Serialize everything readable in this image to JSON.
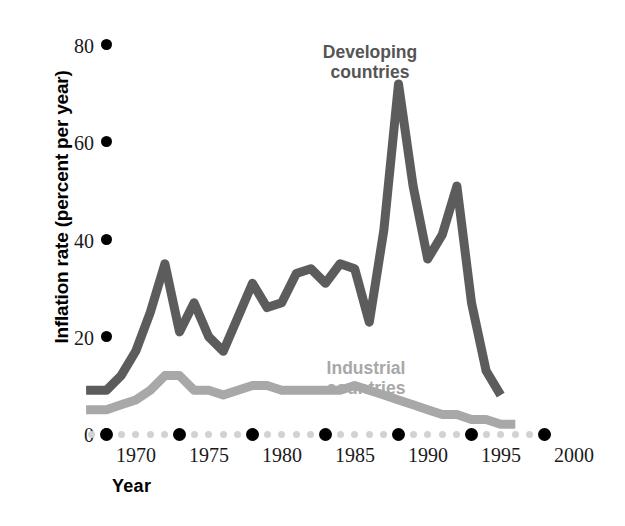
{
  "chart_data": {
    "type": "line",
    "title": "",
    "xlabel": "Year",
    "ylabel": "Inflation rate (percent per year)",
    "xlim": [
      1968,
      2001
    ],
    "ylim": [
      0,
      84
    ],
    "grid": false,
    "legend_position": "inline-annotation",
    "xticks": [
      "1970",
      "1975",
      "1980",
      "1985",
      "1990",
      "1995",
      "2000"
    ],
    "xtick_values": [
      1970,
      1975,
      1980,
      1985,
      1990,
      1995,
      2000
    ],
    "yticks": [
      "0",
      "20",
      "40",
      "60",
      "80"
    ],
    "ytick_values": [
      0,
      20,
      40,
      60,
      80
    ],
    "colors": {
      "developing": "#5c5c5c",
      "industrial": "#a8a8a8",
      "axis_dot_major": "#000000",
      "axis_dot_minor": "#d2d2d2",
      "text": "#1a1a1a"
    },
    "series": [
      {
        "name": "Developing countries",
        "color": "#5c5c5c",
        "x": [
          1968.6,
          1970,
          1971,
          1972,
          1973,
          1974,
          1975,
          1976,
          1977,
          1978,
          1979,
          1980,
          1981,
          1982,
          1983,
          1984,
          1985,
          1986,
          1987,
          1988,
          1989,
          1990,
          1991,
          1992,
          1993,
          1994,
          1995,
          1996,
          1997
        ],
        "values": [
          9,
          9,
          12,
          17,
          25,
          35,
          21,
          27,
          20,
          17,
          24,
          31,
          26,
          27,
          33,
          34,
          31,
          35,
          34,
          23,
          42,
          72,
          51,
          36,
          41,
          51,
          27,
          13,
          8
        ]
      },
      {
        "name": "Industrial countries",
        "color": "#a8a8a8",
        "x": [
          1968.6,
          1970,
          1971,
          1972,
          1973,
          1974,
          1975,
          1976,
          1977,
          1978,
          1979,
          1980,
          1981,
          1982,
          1983,
          1984,
          1985,
          1986,
          1987,
          1988,
          1989,
          1990,
          1991,
          1992,
          1993,
          1994,
          1995,
          1996,
          1997,
          1998
        ],
        "values": [
          5,
          5,
          6,
          7,
          9,
          12,
          12,
          9,
          9,
          8,
          9,
          10,
          10,
          9,
          9,
          9,
          9,
          9,
          10,
          9,
          8,
          7,
          6,
          5,
          4,
          4,
          3,
          3,
          2,
          2
        ]
      }
    ],
    "annotations": [
      {
        "name": "developing-countries-label",
        "text": "Developing\ncountries"
      },
      {
        "name": "industrial-countries-label",
        "text": "Industrial\ncountries"
      }
    ]
  }
}
